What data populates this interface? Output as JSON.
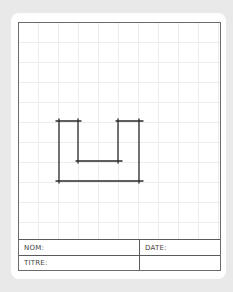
{
  "sheet": {
    "background_color": "#e9e9e9",
    "card_color": "#ffffff",
    "grid_color": "#ececec",
    "grid_spacing_px": 20,
    "frame_color": "#6b6b6b"
  },
  "drawing": {
    "description": "Hand-drawn U-shaped outline (two columns joined at bottom)",
    "stroke_color": "#2a2a2a",
    "segments": [
      {
        "name": "left-top-cap",
        "x1": 56,
        "y1": 121,
        "x2": 81,
        "y2": 121
      },
      {
        "name": "right-top-cap",
        "x1": 116,
        "y1": 121,
        "x2": 143,
        "y2": 121
      },
      {
        "name": "left-outer-vertical",
        "x1": 59,
        "y1": 119,
        "x2": 59,
        "y2": 183
      },
      {
        "name": "left-inner-vertical",
        "x1": 78,
        "y1": 119,
        "x2": 78,
        "y2": 163
      },
      {
        "name": "right-inner-vertical",
        "x1": 118,
        "y1": 119,
        "x2": 118,
        "y2": 163
      },
      {
        "name": "right-outer-vertical",
        "x1": 139,
        "y1": 119,
        "x2": 139,
        "y2": 183
      },
      {
        "name": "inner-bottom",
        "x1": 76,
        "y1": 161,
        "x2": 122,
        "y2": 161
      },
      {
        "name": "outer-bottom",
        "x1": 56,
        "y1": 181,
        "x2": 143,
        "y2": 181
      }
    ]
  },
  "title_block": {
    "name_label": "NOM:",
    "date_label": "DATE:",
    "title_label": "TITRE:",
    "empty_cell": ""
  }
}
